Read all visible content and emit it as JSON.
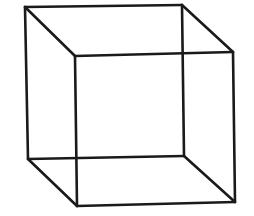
{
  "figure": {
    "kind": "necker-cube-wireframe",
    "stroke_color": "#1a1a1a",
    "background": "#ffffff",
    "vertices": {
      "back_top_left": [
        25,
        7
      ],
      "back_top_right": [
        182,
        5
      ],
      "back_bottom_left": [
        28,
        159
      ],
      "back_bottom_right": [
        184,
        156
      ],
      "front_top_left": [
        75,
        56
      ],
      "front_top_right": [
        233,
        52
      ],
      "front_bottom_left": [
        77,
        206
      ],
      "front_bottom_right": [
        235,
        202
      ]
    }
  }
}
